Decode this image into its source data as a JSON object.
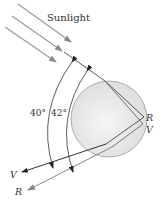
{
  "diagram": {
    "labels": {
      "sunlight": "Sunlight",
      "angle_violet": "40°",
      "angle_red": "42°",
      "point_r": "R",
      "point_v": "V",
      "ray_v": "V",
      "ray_r": "R"
    },
    "colors": {
      "droplet_fill": "#e4e4e4",
      "droplet_stroke": "#9a9a9a",
      "ray_dark": "#333333",
      "ray_gray": "#888888",
      "text": "#333333"
    }
  }
}
